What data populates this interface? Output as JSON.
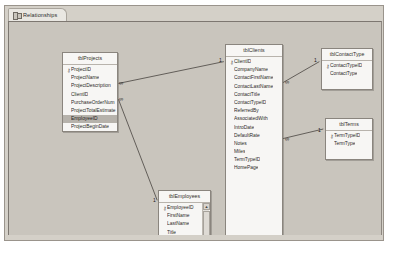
{
  "window": {
    "tab": {
      "label": "Relationships",
      "icon": "relationships-icon"
    }
  },
  "canvas": {
    "background_color": "#c9c5bd"
  },
  "tables": [
    {
      "id": "tblProjects",
      "title": "tblProjects",
      "x": 53,
      "y": 30,
      "width": 56,
      "height": 80,
      "scrollbar": false,
      "fields": [
        {
          "name": "ProjectID",
          "pk": true,
          "selected": false
        },
        {
          "name": "ProjectName",
          "pk": false,
          "selected": false
        },
        {
          "name": "ProjectDescription",
          "pk": false,
          "selected": false
        },
        {
          "name": "ClientID",
          "pk": false,
          "selected": false
        },
        {
          "name": "PurchaseOrderNum",
          "pk": false,
          "selected": false
        },
        {
          "name": "ProjectTotalEstimate",
          "pk": false,
          "selected": false
        },
        {
          "name": "EmployeeID",
          "pk": false,
          "selected": true
        },
        {
          "name": "ProjectBeginDate",
          "pk": false,
          "selected": false
        },
        {
          "name": "ProjectEndDate",
          "pk": false,
          "selected": false
        }
      ]
    },
    {
      "id": "tblClients",
      "title": "tblClients",
      "x": 216,
      "y": 22,
      "width": 58,
      "height": 205,
      "scrollbar": false,
      "fields": [
        {
          "name": "ClientID",
          "pk": true,
          "selected": false
        },
        {
          "name": "CompanyName",
          "pk": false,
          "selected": false
        },
        {
          "name": "ContactFirstName",
          "pk": false,
          "selected": false
        },
        {
          "name": "ContactLastName",
          "pk": false,
          "selected": false
        },
        {
          "name": "ContactTitle",
          "pk": false,
          "selected": false
        },
        {
          "name": "ContactTypeID",
          "pk": false,
          "selected": false
        },
        {
          "name": "ReferredBy",
          "pk": false,
          "selected": false
        },
        {
          "name": "AssociatedWith",
          "pk": false,
          "selected": false
        },
        {
          "name": "IntroDate",
          "pk": false,
          "selected": false
        },
        {
          "name": "DefaultRate",
          "pk": false,
          "selected": false
        },
        {
          "name": "Notes",
          "pk": false,
          "selected": false
        },
        {
          "name": "Miles",
          "pk": false,
          "selected": false
        },
        {
          "name": "TermTypeID",
          "pk": false,
          "selected": false
        },
        {
          "name": "HomePage",
          "pk": false,
          "selected": false
        }
      ]
    },
    {
      "id": "tblContactType",
      "title": "tblContactType",
      "x": 312,
      "y": 26,
      "width": 52,
      "height": 42,
      "scrollbar": false,
      "fields": [
        {
          "name": "ContactTypeID",
          "pk": true,
          "selected": false
        },
        {
          "name": "ContactType",
          "pk": false,
          "selected": false
        }
      ]
    },
    {
      "id": "tblTerms",
      "title": "tblTerms",
      "x": 316,
      "y": 96,
      "width": 48,
      "height": 42,
      "scrollbar": false,
      "fields": [
        {
          "name": "TermTypeID",
          "pk": true,
          "selected": false
        },
        {
          "name": "TermType",
          "pk": false,
          "selected": false
        }
      ]
    },
    {
      "id": "tblEmployees",
      "title": "tblEmployees",
      "x": 149,
      "y": 168,
      "width": 53,
      "height": 68,
      "scrollbar": true,
      "fields": [
        {
          "name": "EmployeeID",
          "pk": true,
          "selected": false
        },
        {
          "name": "FirstName",
          "pk": false,
          "selected": false
        },
        {
          "name": "LastName",
          "pk": false,
          "selected": false
        },
        {
          "name": "Title",
          "pk": false,
          "selected": false
        },
        {
          "name": "EmailName",
          "pk": false,
          "selected": false
        },
        {
          "name": "Extension",
          "pk": false,
          "selected": false
        }
      ]
    }
  ],
  "relationships": [
    {
      "id": "clients-projects",
      "from_table": "tblClients",
      "from_field": "ClientID",
      "to_table": "tblProjects",
      "to_field": "ClientID",
      "one_label": "1",
      "many_label": "∞",
      "x1": 216,
      "y1": 40,
      "x2": 110,
      "y2": 62
    },
    {
      "id": "employees-projects",
      "from_table": "tblEmployees",
      "from_field": "EmployeeID",
      "to_table": "tblProjects",
      "to_field": "EmployeeID",
      "one_label": "1",
      "many_label": "∞",
      "x1": 149,
      "y1": 180,
      "x2": 110,
      "y2": 78
    },
    {
      "id": "contacttype-clients",
      "from_table": "tblContactType",
      "from_field": "ContactTypeID",
      "to_table": "tblClients",
      "to_field": "ContactTypeID",
      "one_label": "1",
      "many_label": "∞",
      "x1": 312,
      "y1": 40,
      "x2": 274,
      "y2": 62
    },
    {
      "id": "terms-clients",
      "from_table": "tblTerms",
      "from_field": "TermTypeID",
      "to_table": "tblClients",
      "to_field": "TermTypeID",
      "one_label": "1",
      "many_label": "∞",
      "x1": 316,
      "y1": 108,
      "x2": 274,
      "y2": 118
    }
  ],
  "markers": [
    {
      "id": "m-projects-clientid",
      "label": "∞",
      "x": 110,
      "y": 59
    },
    {
      "id": "m-projects-employeeid",
      "label": "∞",
      "x": 110,
      "y": 75
    },
    {
      "id": "m-clients-one",
      "label": "1",
      "x": 210,
      "y": 36
    },
    {
      "id": "m-clients-contacttype",
      "label": "∞",
      "x": 276,
      "y": 58
    },
    {
      "id": "m-contacttype-one",
      "label": "1",
      "x": 305,
      "y": 36
    },
    {
      "id": "m-clients-termtype",
      "label": "∞",
      "x": 276,
      "y": 115
    },
    {
      "id": "m-terms-one",
      "label": "1",
      "x": 309,
      "y": 106
    },
    {
      "id": "m-employees-one",
      "label": "1",
      "x": 144,
      "y": 176
    }
  ]
}
